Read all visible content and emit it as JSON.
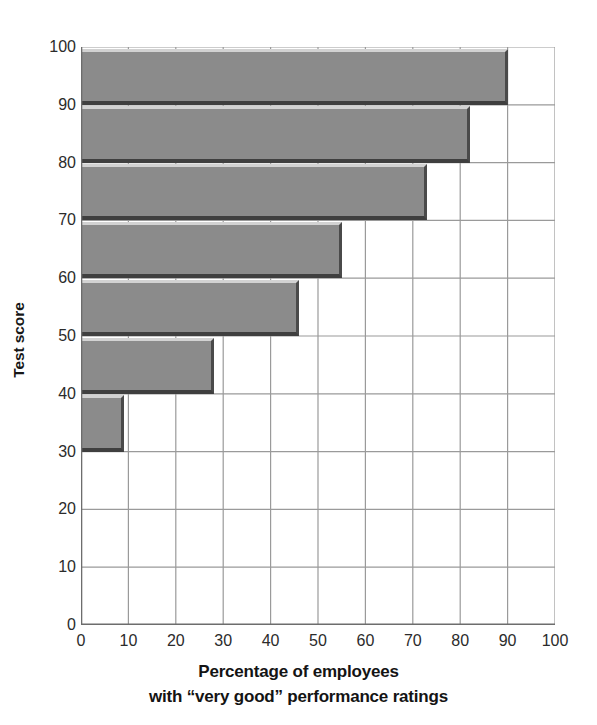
{
  "chart_data": {
    "type": "bar",
    "orientation": "horizontal",
    "title": "",
    "xlabel_line1": "Percentage of employees",
    "xlabel_line2": "with “very good” performance ratings",
    "ylabel": "Test score",
    "xlim": [
      0,
      100
    ],
    "ylim": [
      0,
      100
    ],
    "grid": true,
    "legend": "none",
    "x_ticks": [
      0,
      10,
      20,
      30,
      40,
      50,
      60,
      70,
      80,
      90,
      100
    ],
    "y_ticks": [
      0,
      10,
      20,
      30,
      40,
      50,
      60,
      70,
      80,
      90,
      100
    ],
    "x_tick_labels": [
      "0",
      "10",
      "20",
      "30",
      "40",
      "50",
      "60",
      "70",
      "80",
      "90",
      "100"
    ],
    "y_tick_labels": [
      "0",
      "10",
      "20",
      "30",
      "40",
      "50",
      "60",
      "70",
      "80",
      "90",
      "100"
    ],
    "bar_color": "#8b8b8b",
    "bar_edge_color": "#3f3f3f",
    "grid_color": "#9a9a9a",
    "categories": [
      "30-40",
      "40-50",
      "50-60",
      "60-70",
      "70-80",
      "80-90",
      "90-100"
    ],
    "bins": [
      {
        "label": "30-40",
        "y_low": 30,
        "y_high": 40,
        "value": 9
      },
      {
        "label": "40-50",
        "y_low": 40,
        "y_high": 50,
        "value": 28
      },
      {
        "label": "50-60",
        "y_low": 50,
        "y_high": 60,
        "value": 46
      },
      {
        "label": "60-70",
        "y_low": 60,
        "y_high": 70,
        "value": 55
      },
      {
        "label": "70-80",
        "y_low": 70,
        "y_high": 80,
        "value": 73
      },
      {
        "label": "80-90",
        "y_low": 80,
        "y_high": 90,
        "value": 82
      },
      {
        "label": "90-100",
        "y_low": 90,
        "y_high": 100,
        "value": 90
      }
    ],
    "values": [
      9,
      28,
      46,
      55,
      73,
      82,
      90
    ]
  }
}
